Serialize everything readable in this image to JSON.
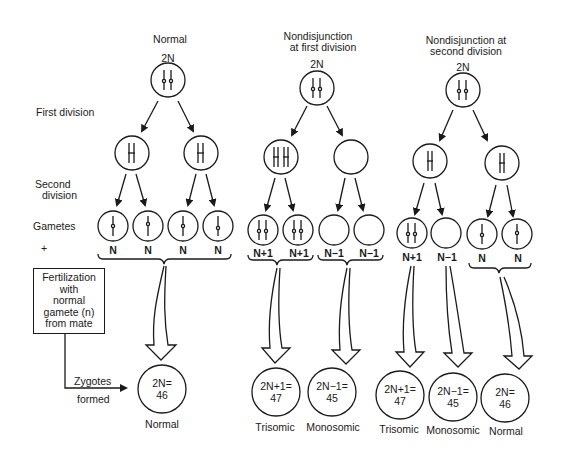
{
  "columns": {
    "normal": {
      "title": "Normal",
      "parent": "2N",
      "gametes": [
        "N",
        "N",
        "N",
        "N"
      ],
      "zygote": {
        "formula": "2N=",
        "count": "46",
        "label": "Normal"
      }
    },
    "first_division_nondisjunction": {
      "title_line1": "Nondisjunction",
      "title_line2": "at first division",
      "parent": "2N",
      "gametes": [
        "N+1",
        "N+1",
        "N−1",
        "N−1"
      ],
      "zygotes": [
        {
          "formula": "2N+1=",
          "count": "47",
          "label": "Trisomic"
        },
        {
          "formula": "2N−1=",
          "count": "45",
          "label": "Monosomic"
        }
      ]
    },
    "second_division_nondisjunction": {
      "title_line1": "Nondisjunction at",
      "title_line2": "second division",
      "parent": "2N",
      "gametes": [
        "N+1",
        "N−1",
        "N",
        "N"
      ],
      "zygotes": [
        {
          "formula": "2N+1=",
          "count": "47",
          "label": "Trisomic"
        },
        {
          "formula": "2N−1=",
          "count": "45",
          "label": "Monosomic"
        },
        {
          "formula": "2N=",
          "count": "46",
          "label": "Normal"
        }
      ]
    }
  },
  "row_labels": {
    "first_division": "First division",
    "second_division_line1": "Second",
    "second_division_line2": "division",
    "gametes": "Gametes",
    "plus": "+"
  },
  "fertilization_box": [
    "Fertilization",
    "with",
    "normal",
    "gamete (n)",
    "from mate"
  ],
  "zygotes_label_line1": "Zygotes",
  "zygotes_label_line2": "formed"
}
